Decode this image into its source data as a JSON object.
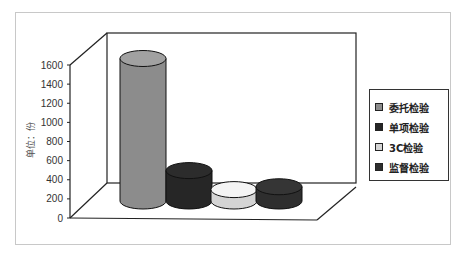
{
  "chart_data": {
    "type": "bar",
    "style": "3d-cylinder",
    "title": "",
    "xlabel": "",
    "ylabel": "单位：份",
    "ylim": [
      0,
      1600
    ],
    "yticks": [
      0,
      200,
      400,
      600,
      800,
      1000,
      1200,
      1400,
      1600
    ],
    "grid": false,
    "legend_position": "right",
    "series": [
      {
        "name": "委托检验",
        "value": 1500,
        "color": "#8c8c8c"
      },
      {
        "name": "单项检验",
        "value": 320,
        "color": "#262626"
      },
      {
        "name": "3C检验",
        "value": 120,
        "color": "#d4d4d4"
      },
      {
        "name": "监督检验",
        "value": 150,
        "color": "#2e2e2e"
      }
    ]
  }
}
